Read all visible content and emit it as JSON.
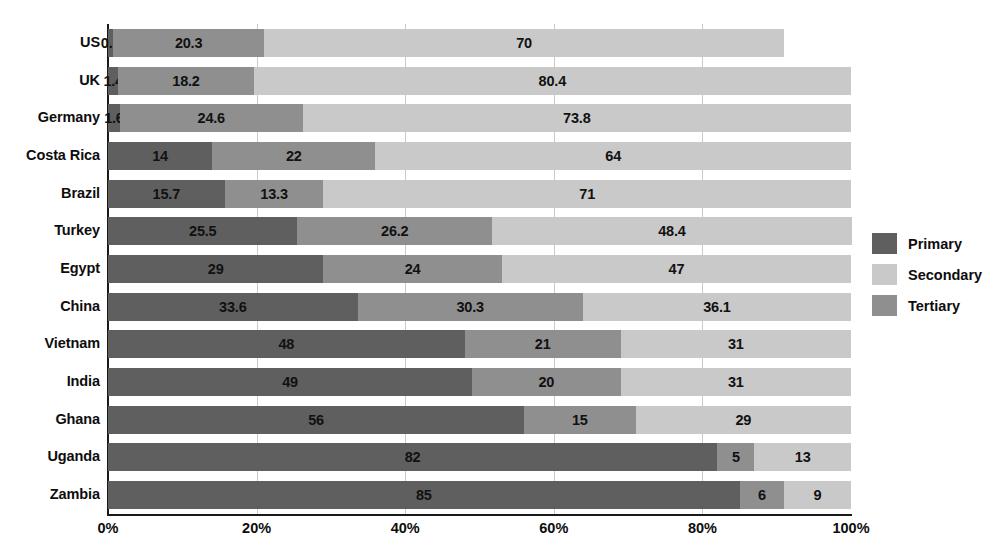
{
  "chart_data": {
    "type": "bar",
    "orientation": "horizontal",
    "stacked": true,
    "normalized": true,
    "title": "",
    "xlabel": "",
    "ylabel": "",
    "xlim": [
      0,
      100
    ],
    "grid": true,
    "legend_position": "right",
    "x_ticks": [
      "0%",
      "20%",
      "40%",
      "60%",
      "80%",
      "100%"
    ],
    "x_tick_values": [
      0,
      20,
      40,
      60,
      80,
      100
    ],
    "categories": [
      "US",
      "UK",
      "Germany",
      "Costa Rica",
      "Brazil",
      "Turkey",
      "Egypt",
      "China",
      "Vietnam",
      "India",
      "Ghana",
      "Uganda",
      "Zambia"
    ],
    "series": [
      {
        "name": "Primary",
        "color": "#5f5f5f",
        "values": [
          0.7,
          1.4,
          1.6,
          14,
          15.7,
          25.5,
          29,
          33.6,
          48,
          49,
          56,
          82,
          85
        ],
        "labels": [
          "0.7",
          "1.4",
          "1.6",
          "14",
          "15.7",
          "25.5",
          "29",
          "33.6",
          "48",
          "49",
          "56",
          "82",
          "85"
        ]
      },
      {
        "name": "Secondary",
        "color": "#8f8f8f",
        "values": [
          20.3,
          18.2,
          24.6,
          22,
          13.3,
          26.2,
          24,
          30.3,
          21,
          20,
          15,
          5,
          6
        ],
        "labels": [
          "20.3",
          "18.2",
          "24.6",
          "22",
          "13.3",
          "26.2",
          "24",
          "30.3",
          "21",
          "20",
          "15",
          "5",
          "6"
        ]
      },
      {
        "name": "Tertiary",
        "color": "#c9c9c9",
        "values": [
          70,
          80.4,
          73.8,
          64,
          71,
          48.4,
          47,
          36.1,
          31,
          31,
          29,
          13,
          9
        ],
        "labels": [
          "70",
          "80.4",
          "73.8",
          "64",
          "71",
          "48.4",
          "47",
          "36.1",
          "31",
          "31",
          "29",
          "13",
          "9"
        ]
      }
    ]
  },
  "legend": {
    "items": [
      {
        "label": "Primary",
        "color": "#5f5f5f"
      },
      {
        "label": "Secondary",
        "color": "#c9c9c9"
      },
      {
        "label": "Tertiary",
        "color": "#8f8f8f"
      }
    ]
  }
}
